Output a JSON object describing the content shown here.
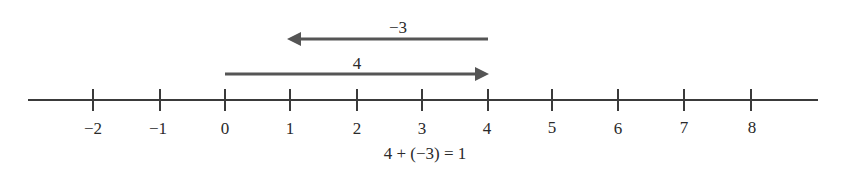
{
  "diagram": {
    "type": "number-line-addition",
    "number_line": {
      "min": -2,
      "max": 8,
      "ticks": [
        {
          "value": -2,
          "label": "−2",
          "x": 93
        },
        {
          "value": -1,
          "label": "−1",
          "x": 160
        },
        {
          "value": 0,
          "label": "0",
          "x": 225
        },
        {
          "value": 1,
          "label": "1",
          "x": 290
        },
        {
          "value": 2,
          "label": "2",
          "x": 357
        },
        {
          "value": 3,
          "label": "3",
          "x": 422
        },
        {
          "value": 4,
          "label": "4",
          "x": 488
        },
        {
          "value": 5,
          "label": "5",
          "x": 552
        },
        {
          "value": 6,
          "label": "6",
          "x": 618
        },
        {
          "value": 7,
          "label": "7",
          "x": 684
        },
        {
          "value": 8,
          "label": "8",
          "x": 751
        }
      ]
    },
    "arrows": [
      {
        "name": "positive-four",
        "label": "4",
        "from": 0,
        "to": 4,
        "direction": "right"
      },
      {
        "name": "negative-three",
        "label": "−3",
        "from": 4,
        "to": 1,
        "direction": "left"
      }
    ],
    "equation": "4 + (−3) = 1",
    "colors": {
      "line": "#3a3a3a",
      "arrow": "#555555",
      "text": "#2a2a2a"
    }
  }
}
